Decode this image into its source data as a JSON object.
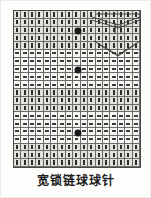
{
  "caption": {
    "text": "宽锁链球球针"
  },
  "chart_data": {
    "type": "table",
    "title": "宽锁链球球针",
    "xlabel": "",
    "ylabel": "",
    "columns": 17,
    "rows": 20,
    "legend": [
      {
        "symbol": "|",
        "name": "vertical-stitch"
      },
      {
        "symbol": "—",
        "name": "horizontal-stitch"
      },
      {
        "symbol": "●",
        "name": "bobble-stitch"
      }
    ],
    "row_bands": [
      {
        "from_row": 1,
        "to_row": 5,
        "symbol": "|",
        "name": "vertical-stitch"
      },
      {
        "from_row": 6,
        "to_row": 10,
        "symbol": "—",
        "name": "horizontal-stitch"
      },
      {
        "from_row": 11,
        "to_row": 13,
        "symbol": "|",
        "name": "vertical-stitch"
      },
      {
        "from_row": 14,
        "to_row": 17,
        "symbol": "—",
        "name": "horizontal-stitch"
      },
      {
        "from_row": 18,
        "to_row": 20,
        "symbol": "|",
        "name": "vertical-stitch"
      }
    ],
    "bobbles": [
      {
        "row": 3,
        "col": 9,
        "label": "●"
      },
      {
        "row": 8,
        "col": 9,
        "label": "●"
      },
      {
        "row": 16,
        "col": 9,
        "label": "●"
      }
    ],
    "motif": {
      "name": "converging-diagonals",
      "region": {
        "row_from": 1,
        "row_to": 6,
        "col_from": 11,
        "col_to": 17
      },
      "description": "diagonal lines converging to a center point"
    },
    "colors": {
      "grid_line": "#6b6b6b",
      "frame": "#4a4a4a",
      "cell_light": "#f6f6f2",
      "cell_dark": "#e2e2db",
      "stitch": "#2d2d2d",
      "bobble": "#1a1a1a",
      "background": "#fdfdfb"
    }
  }
}
